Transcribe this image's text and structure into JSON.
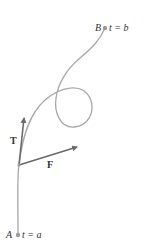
{
  "diagram": {
    "type": "space-curve-with-vectors",
    "points": {
      "start": {
        "name": "A",
        "param": "t = a"
      },
      "end": {
        "name": "B",
        "param": "t = b"
      }
    },
    "vectors": {
      "tangent": {
        "label": "T"
      },
      "force": {
        "label": "F"
      }
    },
    "colors": {
      "curve": "#a8a8a8",
      "vector": "#6a6a6a",
      "point": "#9a9a9a",
      "text": "#333333"
    }
  }
}
